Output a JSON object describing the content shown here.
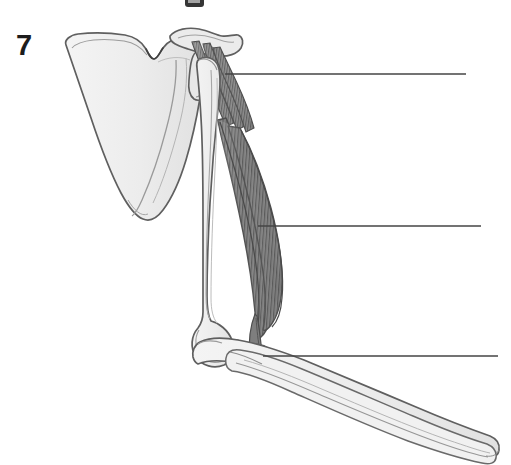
{
  "figure": {
    "number_label": "7",
    "caption": "",
    "background_color": "#ffffff",
    "ink_color": "#5a5a5a",
    "bone_fill_color": "#eeeeee",
    "muscle_fill_color": "#8a8a8a",
    "muscle_fiber_color": "#5d5d5d",
    "number_color": "#1c1c1c",
    "leader_line_color": "#444444",
    "width": 511,
    "height": 465
  },
  "partial_glyph": {
    "name": "cropped-glyph-top",
    "description": "partial black character cropped at top edge",
    "color": "#242424"
  },
  "structures": [
    {
      "id": "scapula",
      "label": "scapula",
      "fill": "#eeeeee",
      "stroke": "#5a5a5a"
    },
    {
      "id": "acromion",
      "label": "acromion",
      "fill": "#ececec",
      "stroke": "#5a5a5a"
    },
    {
      "id": "humerus",
      "label": "humerus",
      "fill": "#efefef",
      "stroke": "#5a5a5a"
    },
    {
      "id": "biceps-brachii",
      "label": "biceps brachii muscle",
      "fill": "#8a8a8a",
      "stroke": "#4f4f4f"
    },
    {
      "id": "biceps-tendon",
      "label": "biceps tendon",
      "fill": "#7c7c7c",
      "stroke": "#4f4f4f"
    },
    {
      "id": "radius",
      "label": "radius",
      "fill": "#efefef",
      "stroke": "#5a5a5a"
    },
    {
      "id": "ulna",
      "label": "ulna",
      "fill": "#efefef",
      "stroke": "#5a5a5a"
    }
  ],
  "leader_lines": [
    {
      "id": "leader-1",
      "label": "",
      "target": "proximal tendon / shoulder",
      "x1": 225,
      "y1": 74,
      "x2": 466,
      "y2": 74
    },
    {
      "id": "leader-2",
      "label": "",
      "target": "muscle belly",
      "x1": 258,
      "y1": 226,
      "x2": 481,
      "y2": 226
    },
    {
      "id": "leader-3",
      "label": "",
      "target": "distal tendon insertion / elbow",
      "x1": 263,
      "y1": 356,
      "x2": 498,
      "y2": 356
    }
  ]
}
